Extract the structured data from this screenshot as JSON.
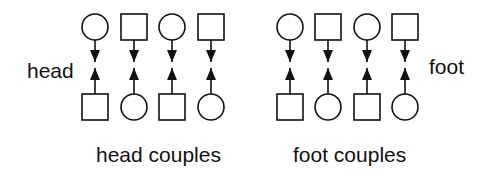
{
  "diagram": {
    "labels": {
      "head": "head",
      "foot": "foot"
    },
    "captions": {
      "head_group": "head couples",
      "foot_group": "foot couples"
    },
    "legend_semantics": {
      "circle": "circle-dancer",
      "square": "square-dancer",
      "arrow": "facing-direction"
    },
    "groups": [
      {
        "name": "head couples",
        "columns": [
          {
            "top": "circle",
            "bottom": "square",
            "top_arrow": "down",
            "bottom_arrow": "up"
          },
          {
            "top": "square",
            "bottom": "circle",
            "top_arrow": "down",
            "bottom_arrow": "up"
          },
          {
            "top": "circle",
            "bottom": "square",
            "top_arrow": "down",
            "bottom_arrow": "up"
          },
          {
            "top": "square",
            "bottom": "circle",
            "top_arrow": "down",
            "bottom_arrow": "up"
          }
        ]
      },
      {
        "name": "foot couples",
        "columns": [
          {
            "top": "circle",
            "bottom": "square",
            "top_arrow": "down",
            "bottom_arrow": "up"
          },
          {
            "top": "square",
            "bottom": "circle",
            "top_arrow": "down",
            "bottom_arrow": "up"
          },
          {
            "top": "circle",
            "bottom": "square",
            "top_arrow": "down",
            "bottom_arrow": "up"
          },
          {
            "top": "square",
            "bottom": "circle",
            "top_arrow": "down",
            "bottom_arrow": "up"
          }
        ]
      }
    ],
    "colors": {
      "stroke": "#111111",
      "background": "#ffffff"
    }
  }
}
